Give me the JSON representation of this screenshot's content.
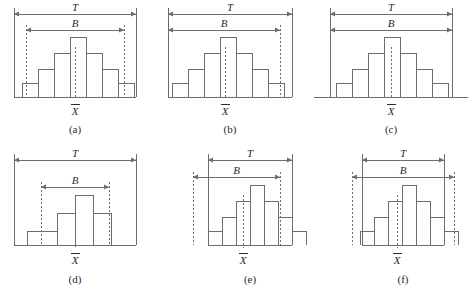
{
  "figure": {
    "title": "",
    "background": "#ffffff",
    "line_color": "#6d6d6d",
    "text_color": "#2b2b2b",
    "width": 472,
    "height": 302
  },
  "labels": {
    "tolerance": "T",
    "spread": "B",
    "mean": "X"
  },
  "panels": [
    {
      "id": "a",
      "caption": "(a)",
      "tolerance_label": "T",
      "spread_label": "B",
      "mean_label": "X",
      "frame": {
        "left": 14,
        "right": 136,
        "top": 8,
        "baseline": 97,
        "sides": "both"
      },
      "t_arrow": {
        "y": 14,
        "x1": 14,
        "x2": 136
      },
      "b_arrow": {
        "y": 30,
        "x1": 26,
        "x2": 124
      },
      "b_dashes": {
        "left": 26,
        "right": 124,
        "show_left": true,
        "show_right": true
      },
      "mean_x": 75,
      "bars": {
        "x_start": 22,
        "width": 16,
        "heights": [
          14,
          28,
          44,
          60,
          44,
          28,
          14
        ]
      },
      "relation": "B inside T",
      "caption_y": 133,
      "mean_label_y": 115
    },
    {
      "id": "b",
      "caption": "(b)",
      "tolerance_label": "T",
      "spread_label": "B",
      "mean_label": "X",
      "frame": {
        "left": 168,
        "right": 292,
        "top": 8,
        "baseline": 97,
        "sides": "both"
      },
      "t_arrow": {
        "y": 14,
        "x1": 168,
        "x2": 292
      },
      "b_arrow": {
        "y": 30,
        "x1": 168,
        "x2": 280
      },
      "b_dashes": {
        "left": 168,
        "right": 280,
        "show_left": false,
        "show_right": true
      },
      "mean_x": 225,
      "bars": {
        "x_start": 172,
        "width": 16,
        "heights": [
          14,
          28,
          44,
          60,
          44,
          28,
          14
        ]
      },
      "relation": "B shifted left within T",
      "caption_y": 133,
      "mean_label_y": 115
    },
    {
      "id": "c",
      "caption": "(c)",
      "tolerance_label": "T",
      "spread_label": "B",
      "mean_label": "X",
      "frame": {
        "left": 330,
        "right": 452,
        "top": 8,
        "baseline": 97,
        "sides": "verticals-only"
      },
      "t_arrow": {
        "y": 14,
        "x1": 330,
        "x2": 452
      },
      "b_arrow": {
        "y": 30,
        "x1": 330,
        "x2": 452
      },
      "b_dashes": {
        "left": 330,
        "right": 452,
        "show_left": false,
        "show_right": false
      },
      "mean_x": 391,
      "bars": {
        "x_start": 336,
        "width": 16,
        "heights": [
          14,
          28,
          44,
          60,
          44,
          28,
          14
        ]
      },
      "relation": "B equals T",
      "caption_y": 133,
      "mean_label_y": 115
    },
    {
      "id": "d",
      "caption": "(d)",
      "tolerance_label": "T",
      "spread_label": "B",
      "mean_label": "X",
      "frame": {
        "left": 14,
        "right": 136,
        "top": 154,
        "baseline": 245,
        "sides": "both"
      },
      "t_arrow": {
        "y": 160,
        "x1": 14,
        "x2": 136
      },
      "b_arrow": {
        "y": 187,
        "x1": 41,
        "x2": 109
      },
      "b_dashes": {
        "left": 41,
        "right": 109,
        "show_left": true,
        "show_right": true
      },
      "mean_x": 75,
      "bars": {
        "x_start": 57,
        "width": 18,
        "heights": [
          32,
          50,
          32
        ],
        "tails": {
          "height": 14,
          "left_x": 27,
          "right_x": 111
        }
      },
      "relation": "B much narrower than T",
      "caption_y": 283,
      "mean_label_y": 264
    },
    {
      "id": "e",
      "caption": "(e)",
      "tolerance_label": "T",
      "spread_label": "B",
      "mean_label": "X",
      "frame": {
        "left": 208,
        "right": 292,
        "top": 154,
        "baseline": 245,
        "sides": "both"
      },
      "t_arrow": {
        "y": 160,
        "x1": 208,
        "x2": 292
      },
      "b_arrow": {
        "y": 177,
        "x1": 193,
        "x2": 280
      },
      "b_dashes": {
        "left": 193,
        "right": 280,
        "show_left": true,
        "show_right": true
      },
      "mean_x": 243,
      "bars": {
        "x_start": 208,
        "width": 14,
        "heights": [
          14,
          28,
          44,
          60,
          44,
          28,
          14
        ]
      },
      "relation": "B extends past T on left",
      "caption_y": 283,
      "mean_label_y": 264
    },
    {
      "id": "f",
      "caption": "(f)",
      "tolerance_label": "T",
      "spread_label": "B",
      "mean_label": "X",
      "frame": {
        "left": 362,
        "right": 444,
        "top": 154,
        "baseline": 245,
        "sides": "both"
      },
      "t_arrow": {
        "y": 160,
        "x1": 362,
        "x2": 444
      },
      "b_arrow": {
        "y": 177,
        "x1": 352,
        "x2": 454
      },
      "b_dashes": {
        "left": 352,
        "right": 454,
        "show_left": true,
        "show_right": true
      },
      "mean_x": 397,
      "bars": {
        "x_start": 360,
        "width": 14,
        "heights": [
          14,
          28,
          44,
          60,
          44,
          28,
          14
        ]
      },
      "relation": "B wider than T on both sides",
      "caption_y": 283,
      "mean_label_y": 264
    }
  ]
}
